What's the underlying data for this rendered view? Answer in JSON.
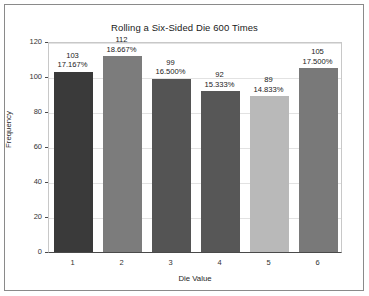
{
  "chart_data": {
    "type": "bar",
    "title": "Rolling a Six-Sided Die 600 Times",
    "xlabel": "Die Value",
    "ylabel": "Frequency",
    "categories": [
      "1",
      "2",
      "3",
      "4",
      "5",
      "6"
    ],
    "values": [
      103,
      112,
      99,
      92,
      89,
      105
    ],
    "percent_labels": [
      "17.167%",
      "18.667%",
      "16.500%",
      "15.333%",
      "14.833%",
      "17.500%"
    ],
    "count_labels": [
      "103",
      "112",
      "99",
      "92",
      "89",
      "105"
    ],
    "bar_colors": [
      "#3a3a3a",
      "#7c7c7c",
      "#545454",
      "#575757",
      "#b9b9b9",
      "#797979"
    ],
    "ylim": [
      0,
      120
    ],
    "yticks": [
      0,
      20,
      40,
      60,
      80,
      100,
      120
    ],
    "ytick_labels": [
      "0",
      "20",
      "40",
      "60",
      "80",
      "100",
      "120"
    ],
    "grid": true,
    "legend": false,
    "total_rolls": 600
  },
  "figure": {
    "background": "#ffffff",
    "frame_color": "#8a8a8a",
    "axis_color": "#4a4a4a",
    "grid_color": "#e2e2e2"
  }
}
